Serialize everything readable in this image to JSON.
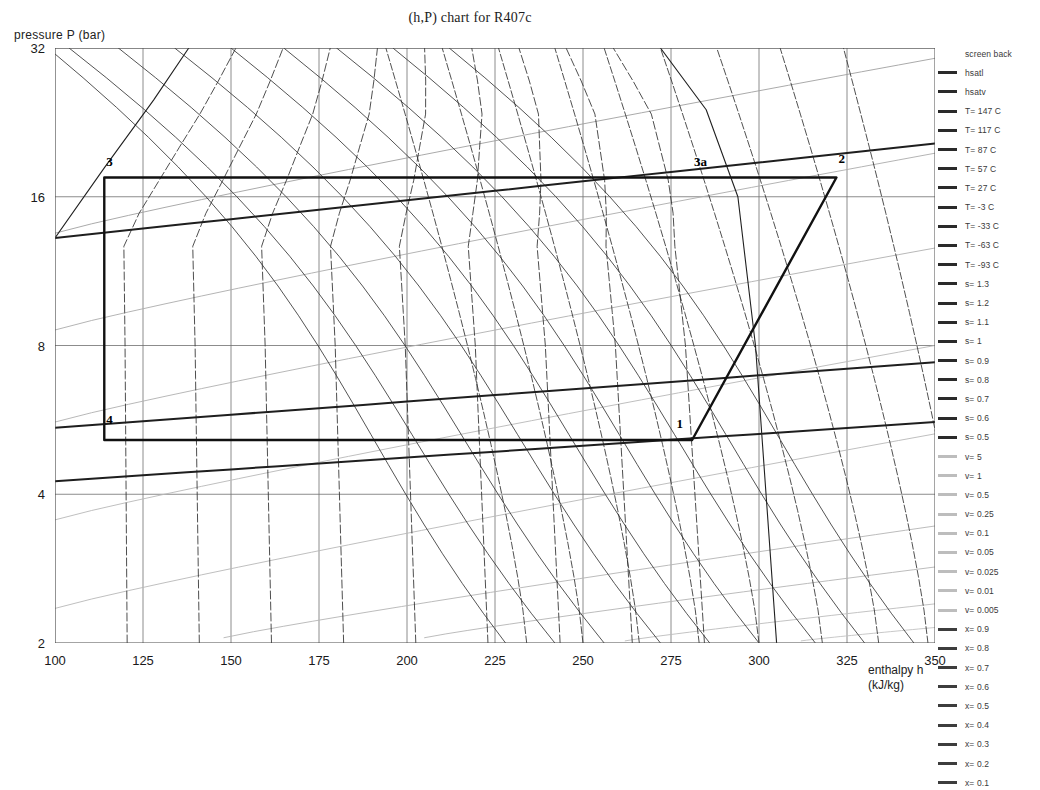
{
  "chart_data": {
    "type": "line",
    "title": "(h,P) chart for R407c",
    "xlabel": "enthalpy h",
    "xlabel_units": "(kJ/kg)",
    "ylabel": "pressure  P (bar)",
    "xlim": [
      100,
      350
    ],
    "ylim": [
      2,
      32
    ],
    "yscale": "log",
    "xscale": "linear",
    "grid": true,
    "xticks": [
      100,
      125,
      150,
      175,
      200,
      225,
      250,
      275,
      300,
      325,
      350
    ],
    "yticks": [
      2,
      4,
      8,
      16,
      32
    ],
    "xminorticks": [
      112.5,
      137.5,
      162.5,
      187.5,
      212.5,
      237.5,
      262.5,
      287.5,
      312.5,
      337.5
    ],
    "legend_position": "right-outside",
    "annotations": [
      {
        "text": "3",
        "h": 114,
        "p": 18.1
      },
      {
        "text": "3a",
        "h": 281,
        "p": 18.1
      },
      {
        "text": "2",
        "h": 322,
        "p": 18.4
      },
      {
        "text": "4",
        "h": 114,
        "p": 5.45
      },
      {
        "text": "1",
        "h": 276,
        "p": 5.35
      }
    ],
    "cycle": {
      "name": "refrigeration-cycle",
      "points": [
        {
          "label": "1",
          "h": 281,
          "p": 5.15
        },
        {
          "label": "2",
          "h": 322,
          "p": 17.5
        },
        {
          "label": "3a",
          "h": 281,
          "p": 17.5
        },
        {
          "label": "3",
          "h": 114,
          "p": 17.5
        },
        {
          "label": "4",
          "h": 114,
          "p": 5.15
        },
        {
          "label": "1",
          "h": 281,
          "p": 5.15
        }
      ]
    },
    "saturation": {
      "liquid_curve_name": "hsatl",
      "vapour_curve_name": "hsatv",
      "liquid_points": [
        {
          "h": 100,
          "p": 13.2
        },
        {
          "h": 114,
          "p": 18.3
        },
        {
          "h": 128,
          "p": 25.1
        },
        {
          "h": 138,
          "p": 32
        }
      ],
      "vapour_points": [
        {
          "h": 305,
          "p": 2
        },
        {
          "h": 302,
          "p": 4
        },
        {
          "h": 299,
          "p": 8
        },
        {
          "h": 294,
          "p": 16
        },
        {
          "h": 285,
          "p": 24
        },
        {
          "h": 272,
          "p": 32
        }
      ]
    },
    "series": [
      {
        "name": "screen back",
        "kind": "background",
        "color": "#ffffff"
      },
      {
        "name": "hsatl",
        "kind": "saturated-liquid",
        "color": "#202020"
      },
      {
        "name": "hsatv",
        "kind": "saturated-vapour",
        "color": "#202020"
      },
      {
        "name": "T= 147 C",
        "kind": "isotherm",
        "value": 147,
        "unit": "C",
        "color": "#303030"
      },
      {
        "name": "T= 117 C",
        "kind": "isotherm",
        "value": 117,
        "unit": "C",
        "color": "#303030"
      },
      {
        "name": "T= 87 C",
        "kind": "isotherm",
        "value": 87,
        "unit": "C",
        "color": "#303030"
      },
      {
        "name": "T= 57 C",
        "kind": "isotherm",
        "value": 57,
        "unit": "C",
        "color": "#303030"
      },
      {
        "name": "T= 27 C",
        "kind": "isotherm",
        "value": 27,
        "unit": "C",
        "color": "#303030"
      },
      {
        "name": "T= -3 C",
        "kind": "isotherm",
        "value": -3,
        "unit": "C",
        "color": "#303030"
      },
      {
        "name": "T= -33 C",
        "kind": "isotherm",
        "value": -33,
        "unit": "C",
        "color": "#303030"
      },
      {
        "name": "T= -63 C",
        "kind": "isotherm",
        "value": -63,
        "unit": "C",
        "color": "#303030"
      },
      {
        "name": "T= -93 C",
        "kind": "isotherm",
        "value": -93,
        "unit": "C",
        "color": "#303030"
      },
      {
        "name": "s= 1.3",
        "kind": "isentrope",
        "value": 1.3,
        "color": "#353535"
      },
      {
        "name": "s= 1.2",
        "kind": "isentrope",
        "value": 1.2,
        "color": "#353535"
      },
      {
        "name": "s= 1.1",
        "kind": "isentrope",
        "value": 1.1,
        "color": "#353535"
      },
      {
        "name": "s= 1",
        "kind": "isentrope",
        "value": 1.0,
        "color": "#353535"
      },
      {
        "name": "s= 0.9",
        "kind": "isentrope",
        "value": 0.9,
        "color": "#353535"
      },
      {
        "name": "s= 0.8",
        "kind": "isentrope",
        "value": 0.8,
        "color": "#353535"
      },
      {
        "name": "s= 0.7",
        "kind": "isentrope",
        "value": 0.7,
        "color": "#353535"
      },
      {
        "name": "s= 0.6",
        "kind": "isentrope",
        "value": 0.6,
        "color": "#353535"
      },
      {
        "name": "s= 0.5",
        "kind": "isentrope",
        "value": 0.5,
        "color": "#353535"
      },
      {
        "name": "v= 5",
        "kind": "isochore",
        "value": 5,
        "color": "#b8b8b8"
      },
      {
        "name": "v= 1",
        "kind": "isochore",
        "value": 1,
        "color": "#b8b8b8"
      },
      {
        "name": "v= 0.5",
        "kind": "isochore",
        "value": 0.5,
        "color": "#b0b0b0"
      },
      {
        "name": "v= 0.25",
        "kind": "isochore",
        "value": 0.25,
        "color": "#ababab"
      },
      {
        "name": "v= 0.1",
        "kind": "isochore",
        "value": 0.1,
        "color": "#a0a0a0"
      },
      {
        "name": "v= 0.05",
        "kind": "isochore",
        "value": 0.05,
        "color": "#b4b4b4"
      },
      {
        "name": "v= 0.025",
        "kind": "isochore",
        "value": 0.025,
        "color": "#b4b4b4"
      },
      {
        "name": "v= 0.01",
        "kind": "isochore",
        "value": 0.01,
        "color": "#bcbcbc"
      },
      {
        "name": "v= 0.005",
        "kind": "isochore",
        "value": 0.005,
        "color": "#c2c2c2"
      },
      {
        "name": "x= 0.9",
        "kind": "quality",
        "value": 0.9,
        "color": "#2e2e2e"
      },
      {
        "name": "x= 0.8",
        "kind": "quality",
        "value": 0.8,
        "color": "#2e2e2e"
      },
      {
        "name": "x= 0.7",
        "kind": "quality",
        "value": 0.7,
        "color": "#2e2e2e"
      },
      {
        "name": "x= 0.6",
        "kind": "quality",
        "value": 0.6,
        "color": "#2e2e2e"
      },
      {
        "name": "x= 0.5",
        "kind": "quality",
        "value": 0.5,
        "color": "#2e2e2e"
      },
      {
        "name": "x= 0.4",
        "kind": "quality",
        "value": 0.4,
        "color": "#2e2e2e"
      },
      {
        "name": "x= 0.3",
        "kind": "quality",
        "value": 0.3,
        "color": "#2e2e2e"
      },
      {
        "name": "x= 0.2",
        "kind": "quality",
        "value": 0.2,
        "color": "#2e2e2e"
      },
      {
        "name": "x= 0.1",
        "kind": "quality",
        "value": 0.1,
        "color": "#2e2e2e"
      }
    ]
  },
  "legend": {
    "entries": [
      {
        "label": "screen back",
        "style": "none"
      },
      {
        "label": "hsatl",
        "style": "solid-dark"
      },
      {
        "label": "hsatv",
        "style": "solid-dark"
      },
      {
        "label": "T= 147 C",
        "style": "solid-dark"
      },
      {
        "label": "T= 117 C",
        "style": "solid-dark"
      },
      {
        "label": "T= 87 C",
        "style": "solid-dark"
      },
      {
        "label": "T= 57 C",
        "style": "solid-dark"
      },
      {
        "label": "T= 27 C",
        "style": "solid-dark"
      },
      {
        "label": "T= -3 C",
        "style": "solid-dark"
      },
      {
        "label": "T= -33 C",
        "style": "solid-dark"
      },
      {
        "label": "T= -63 C",
        "style": "solid-dark"
      },
      {
        "label": "T= -93 C",
        "style": "solid-dark"
      },
      {
        "label": "s= 1.3",
        "style": "solid-dark"
      },
      {
        "label": "s= 1.2",
        "style": "solid-dark"
      },
      {
        "label": "s= 1.1",
        "style": "solid-dark"
      },
      {
        "label": "s= 1",
        "style": "solid-dark"
      },
      {
        "label": "s= 0.9",
        "style": "solid-dark"
      },
      {
        "label": "s= 0.8",
        "style": "solid-dark"
      },
      {
        "label": "s= 0.7",
        "style": "solid-dark"
      },
      {
        "label": "s= 0.6",
        "style": "solid-dark"
      },
      {
        "label": "s= 0.5",
        "style": "solid-dark"
      },
      {
        "label": "v= 5",
        "style": "solid-light"
      },
      {
        "label": "v= 1",
        "style": "solid-light"
      },
      {
        "label": "v= 0.5",
        "style": "solid-light"
      },
      {
        "label": "v= 0.25",
        "style": "solid-light"
      },
      {
        "label": "v= 0.1",
        "style": "solid-light"
      },
      {
        "label": "v= 0.05",
        "style": "solid-light"
      },
      {
        "label": "v= 0.025",
        "style": "solid-light"
      },
      {
        "label": "v= 0.01",
        "style": "solid-light"
      },
      {
        "label": "v= 0.005",
        "style": "solid-light"
      },
      {
        "label": "x= 0.9",
        "style": "solid-mid"
      },
      {
        "label": "x= 0.8",
        "style": "solid-mid"
      },
      {
        "label": "x= 0.7",
        "style": "solid-mid"
      },
      {
        "label": "x= 0.6",
        "style": "solid-mid"
      },
      {
        "label": "x= 0.5",
        "style": "solid-mid"
      },
      {
        "label": "x= 0.4",
        "style": "solid-mid"
      },
      {
        "label": "x= 0.3",
        "style": "solid-mid"
      },
      {
        "label": "x= 0.2",
        "style": "solid-mid"
      },
      {
        "label": "x= 0.1",
        "style": "solid-mid"
      }
    ]
  },
  "colors": {
    "axis": "#4a4a4a",
    "grid": "#6e6e6e",
    "cycle": "#111111",
    "isotherm": "#303030",
    "isentrope": "#3a3a3a",
    "isochore": "#b5b5b5",
    "quality": "#2e2e2e",
    "text": "#1a1a1a"
  }
}
